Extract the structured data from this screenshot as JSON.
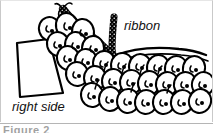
{
  "figure": {
    "kind": "line-art-illustration",
    "background_color": "#ffffff",
    "ink_color": "#000000",
    "border_color": "#c9c9c9",
    "width_px": 213,
    "height_px": 133
  },
  "labels": {
    "ribbon": "ribbon",
    "right_side": "right side"
  },
  "caption": {
    "text": "Figure 2",
    "rule_color": "#b5b5b5"
  },
  "elements": {
    "ribbon_strip_name": "dark textured ribbon",
    "fabric_panel_name": "fabric panel right side",
    "ruffle_name": "scalloped gathered ruffle rows",
    "ruffle_row_count": 4,
    "edge_lines_name": "double curved fabric edge"
  }
}
